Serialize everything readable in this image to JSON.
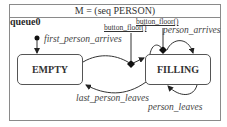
{
  "diagram": {
    "title": "M = (seq PERSON)",
    "initial_label": "queue0",
    "states": [
      {
        "id": "empty",
        "label": "EMPTY"
      },
      {
        "id": "filling",
        "label": "FILLING"
      }
    ],
    "transitions": [
      {
        "from": "initial",
        "to": "empty",
        "label": "first_person_arrives"
      },
      {
        "from": "empty",
        "to": "filling",
        "label": "button_floor()",
        "via": "diamond"
      },
      {
        "from": "filling",
        "to": "filling",
        "label": "person_arrives",
        "action": "button_floor()",
        "via": "diamond"
      },
      {
        "from": "filling",
        "to": "empty",
        "label": "last_person_leaves"
      },
      {
        "from": "filling",
        "to": "filling",
        "label": "person_leaves"
      }
    ],
    "labels": {
      "first_person_arrives": "first_person_arrives",
      "button_floor_1": "button_floor()",
      "button_floor_2": "button_floor()",
      "person_arrives": "person_arrives",
      "last_person_leaves": "last_person_leaves",
      "person_leaves": "person_leaves"
    }
  }
}
